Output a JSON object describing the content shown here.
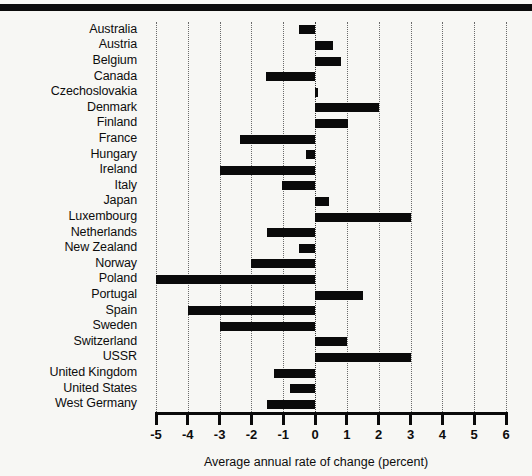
{
  "figure": {
    "axis_title": "Average annual rate of change (percent)",
    "bar_color": "#0a0a0a",
    "background_color": "#f7f7f4",
    "grid_color": "#6b6b6b"
  },
  "chart_data": {
    "type": "bar",
    "orientation": "horizontal",
    "title": "",
    "xlabel": "Average annual rate of change (percent)",
    "ylabel": "",
    "xlim": [
      -5,
      6
    ],
    "xticks": [
      -5,
      -4,
      -3,
      -2,
      -1,
      0,
      1,
      2,
      3,
      4,
      5,
      6
    ],
    "xtick_labels": [
      "-5",
      "-4",
      "-3",
      "-2",
      "-1",
      "0",
      "1",
      "2",
      "3",
      "4",
      "5",
      "6"
    ],
    "grid": true,
    "grid_axis": "x",
    "legend": "none",
    "categories": [
      "Australia",
      "Austria",
      "Belgium",
      "Canada",
      "Czechoslovakia",
      "Denmark",
      "Finland",
      "France",
      "Hungary",
      "Ireland",
      "Italy",
      "Japan",
      "Luxembourg",
      "Netherlands",
      "New Zealand",
      "Norway",
      "Poland",
      "Portugal",
      "Spain",
      "Sweden",
      "Switzerland",
      "USSR",
      "United Kingdom",
      "United States",
      "West Germany"
    ],
    "values": [
      -0.5,
      0.55,
      0.8,
      -1.55,
      0.1,
      2.0,
      1.05,
      -2.35,
      -0.3,
      -3.0,
      -1.05,
      0.45,
      3.0,
      -1.5,
      -0.5,
      -2.0,
      -5.0,
      1.5,
      -4.0,
      -3.0,
      1.0,
      3.0,
      -1.3,
      -0.8,
      -1.5
    ]
  }
}
